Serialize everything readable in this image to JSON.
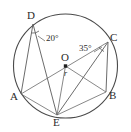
{
  "figure": {
    "kind": "circle-geometry-diagram",
    "background_color": "#ffffff",
    "stroke_color": "#4a4a4a",
    "text_color": "#2b2b2b",
    "circle": {
      "center_label": "O",
      "cx": 65.5,
      "cy": 66,
      "r": 52
    },
    "radius": {
      "label": "r",
      "from": "O",
      "to": "E"
    },
    "vertices": [
      {
        "id": "D",
        "label": "D",
        "x": 33,
        "y": 24,
        "label_x": 27,
        "label_y": 10
      },
      {
        "id": "C",
        "label": "C",
        "x": 108,
        "y": 42,
        "label_x": 110,
        "label_y": 32
      },
      {
        "id": "A",
        "label": "A",
        "x": 21,
        "y": 94,
        "label_x": 10,
        "label_y": 92
      },
      {
        "id": "B",
        "label": "B",
        "x": 106,
        "y": 92,
        "label_x": 109,
        "label_y": 91
      },
      {
        "id": "E",
        "label": "E",
        "x": 57,
        "y": 115,
        "label_x": 53,
        "label_y": 118
      },
      {
        "id": "O",
        "label": "O",
        "x": 65.5,
        "y": 66,
        "label_x": 61,
        "label_y": 52
      }
    ],
    "chords": [
      {
        "name": "chord-D-A",
        "from": "D",
        "to": "A"
      },
      {
        "name": "chord-D-E",
        "from": "D",
        "to": "E"
      },
      {
        "name": "chord-C-E",
        "from": "C",
        "to": "E"
      },
      {
        "name": "chord-C-B",
        "from": "C",
        "to": "B"
      },
      {
        "name": "segment-A-O",
        "from": "A",
        "to": "O"
      },
      {
        "name": "segment-O-C",
        "from": "O",
        "to": "C"
      },
      {
        "name": "segment-O-E",
        "from": "O",
        "to": "E"
      },
      {
        "name": "segment-O-B",
        "from": "O",
        "to": "B"
      },
      {
        "name": "segment-A-E",
        "from": "A",
        "to": "E"
      },
      {
        "name": "segment-E-B",
        "from": "E",
        "to": "B"
      }
    ],
    "angles": [
      {
        "id": "angle-at-D",
        "value": "20°",
        "vertex": "D",
        "label_x": 46,
        "label_y": 38,
        "arc_cx": 33,
        "arc_cy": 24,
        "arc_r": 9,
        "leader_from_x": 45,
        "leader_from_y": 41,
        "leader_to_x": 38,
        "leader_to_y": 36
      },
      {
        "id": "angle-at-C",
        "value": "35°",
        "vertex": "C",
        "label_x": 79,
        "label_y": 48,
        "arc_cx": 108,
        "arc_cy": 42,
        "arc_r": 10,
        "leader_from_x": 94,
        "leader_from_y": 52,
        "leader_to_x": 101,
        "leader_to_y": 48
      }
    ]
  }
}
